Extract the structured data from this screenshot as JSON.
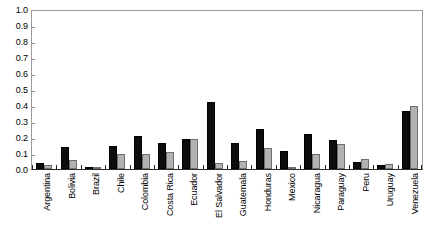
{
  "chart_data": {
    "type": "bar",
    "title": "",
    "subtitle": "",
    "xlabel": "",
    "ylabel": "",
    "ylim": [
      0,
      1.0
    ],
    "ytick_values": [
      1.0,
      0.9,
      0.8,
      0.7,
      0.6,
      0.5,
      0.4,
      0.3,
      0.2,
      0.1,
      0.0
    ],
    "ytick_labels": [
      "1.0",
      "0.9",
      "0.8",
      "0.7",
      "0.6",
      "0.5",
      "0.4",
      "0.3",
      "0.2",
      "0.1",
      "0.0"
    ],
    "grid": false,
    "legend": "none",
    "categories": [
      "Argentina",
      "Bolivia",
      "Brazil",
      "Chile",
      "Colombia",
      "Costa Rica",
      "Ecuador",
      "El Salvador",
      "Guatemala",
      "Honduras",
      "Mexico",
      "Nicaragua",
      "Paraguay",
      "Peru",
      "Uruguay",
      "Venezuela"
    ],
    "series": [
      {
        "name": "series-black",
        "color": "#0d0d0d",
        "values": [
          0.035,
          0.14,
          0.015,
          0.145,
          0.205,
          0.162,
          0.19,
          0.42,
          0.16,
          0.25,
          0.112,
          0.22,
          0.18,
          0.045,
          0.025,
          0.36
        ]
      },
      {
        "name": "series-gray",
        "color": "#b2b2b2",
        "values": [
          0.025,
          0.055,
          0.01,
          0.093,
          0.093,
          0.107,
          0.188,
          0.035,
          0.05,
          0.133,
          0.015,
          0.095,
          0.155,
          0.065,
          0.03,
          0.395
        ]
      }
    ]
  }
}
